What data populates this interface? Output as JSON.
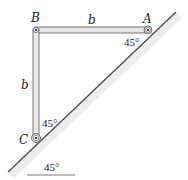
{
  "diagram": {
    "points": {
      "A": "A",
      "B": "B",
      "C": "C"
    },
    "lengths": {
      "BA": "b",
      "BC": "b"
    },
    "angles": {
      "at_A": "45°",
      "at_C": "45°",
      "incline": "45°"
    },
    "colors": {
      "bar_fill": "#e8e8e8",
      "bar_stroke": "#555555",
      "incline_shade": "#bdbdbd",
      "line": "#333333"
    }
  }
}
